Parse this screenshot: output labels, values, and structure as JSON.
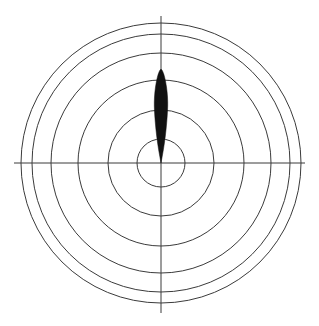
{
  "figure": {
    "width": 319,
    "height": 326,
    "background_color": "#ffffff",
    "title": "",
    "type": "polar-radiation-pattern"
  },
  "chart_data": {
    "type": "line",
    "subtype": "polar",
    "title": "",
    "subtitle": "",
    "xlabel": "",
    "ylabel": "",
    "grid": true,
    "legend_position": "none",
    "center": {
      "x": 161,
      "y": 163
    },
    "axes": {
      "horizontal": {
        "x1": 14,
        "y1": 163,
        "x2": 305,
        "y2": 163
      },
      "vertical": {
        "x1": 161,
        "y1": 16,
        "x2": 161,
        "y2": 313
      }
    },
    "grid_circles": {
      "count": 6,
      "radii_px": [
        24,
        53,
        83,
        110,
        129,
        140
      ],
      "stroke_color": "#3b3b3b",
      "stroke_width": 1
    },
    "rlim": [
      0,
      140
    ],
    "theta_ticks_deg": [
      0,
      90,
      180,
      270
    ],
    "tick_labels": [],
    "annotations": [],
    "series": [
      {
        "name": "main-lobe",
        "fill_color": "#111111",
        "direction_deg": 90,
        "peak_radius_px": 95,
        "max_half_width_px": 7,
        "description": "narrow vertical lens-shaped lobe pointing up from origin",
        "outline_points": [
          [
            161,
            163
          ],
          [
            158.6,
            150
          ],
          [
            156.6,
            136
          ],
          [
            155.2,
            122
          ],
          [
            154.4,
            110
          ],
          [
            154.2,
            102
          ],
          [
            154.8,
            92
          ],
          [
            156.2,
            82
          ],
          [
            158.4,
            73
          ],
          [
            161,
            68
          ],
          [
            163.6,
            73
          ],
          [
            165.8,
            82
          ],
          [
            167.2,
            92
          ],
          [
            167.8,
            102
          ],
          [
            167.6,
            110
          ],
          [
            166.8,
            122
          ],
          [
            165.4,
            136
          ],
          [
            163.4,
            150
          ],
          [
            161,
            163
          ]
        ]
      }
    ]
  }
}
